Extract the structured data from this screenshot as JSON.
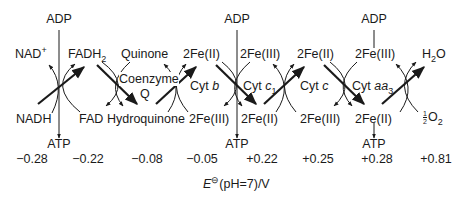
{
  "diagram": {
    "type": "electron-transport-chain-redox-couples",
    "colors": {
      "stroke": "#1a1a1a",
      "background": "#ffffff"
    },
    "top_inputs": [
      {
        "id": "adp1",
        "label": "ADP",
        "x": 59
      },
      {
        "id": "adp2",
        "label": "ADP",
        "x": 237
      },
      {
        "id": "adp3",
        "label": "ADP",
        "x": 374
      }
    ],
    "bottom_outputs": [
      {
        "id": "atp1",
        "label": "ATP",
        "x": 59
      },
      {
        "id": "atp2",
        "label": "ATP",
        "x": 237
      },
      {
        "id": "atp3",
        "label": "ATP",
        "x": 374
      }
    ],
    "upper_labels": {
      "nad": "NAD",
      "nad_sup": "+",
      "fadh": "FADH",
      "fadh_sub": "2",
      "quinone": "Quinone",
      "fe2_1": "2Fe(II)",
      "fe3_1": "2Fe(III)",
      "fe2_2": "2Fe(II)",
      "fe3_2": "2Fe(III)",
      "h2o": "H",
      "h2o_sub": "2",
      "h2o_tail": "O"
    },
    "middle_labels": {
      "coenzyme": "Coenzyme",
      "q": "Q",
      "cyt_b_prefix": "Cyt ",
      "cyt_b_italic": "b",
      "cyt_c1_prefix": "Cyt ",
      "cyt_c1_italic": "c",
      "cyt_c1_sub": "1",
      "cyt_c_prefix": "Cyt ",
      "cyt_c_italic": "c",
      "cyt_aa3_prefix": "Cyt ",
      "cyt_aa3_italic": "aa",
      "cyt_aa3_sub": "3"
    },
    "lower_labels": {
      "nadh": "NADH",
      "fad": "FAD",
      "hydroquinone": "Hydroquinone",
      "fe3_a": "2Fe(III)",
      "fe2_a": "2Fe(II)",
      "fe3_b": "2Fe(III)",
      "fe2_b": "2Fe(II)",
      "o2_num": "1",
      "o2_den": "2",
      "o2": "O",
      "o2_sub": "2"
    },
    "potentials": [
      {
        "couple": "NAD+/NADH",
        "value": "−0.28",
        "x": 26
      },
      {
        "couple": "FAD/FADH2",
        "value": "−0.22",
        "x": 88
      },
      {
        "couple": "Quinone/Hydroquinone",
        "value": "−0.08",
        "x": 147
      },
      {
        "couple": "Cyt b",
        "value": "−0.05",
        "x": 202
      },
      {
        "couple": "Cyt c1",
        "value": "+0.22",
        "x": 262
      },
      {
        "couple": "Cyt c",
        "value": "+0.25",
        "x": 318
      },
      {
        "couple": "Cyt aa3",
        "value": "+0.28",
        "x": 375
      },
      {
        "couple": "O2/H2O",
        "value": "+0.81",
        "x": 435
      }
    ],
    "axis_label": {
      "symbol": "E",
      "superscript": "⊖",
      "text": "(pH=7)/V"
    }
  }
}
